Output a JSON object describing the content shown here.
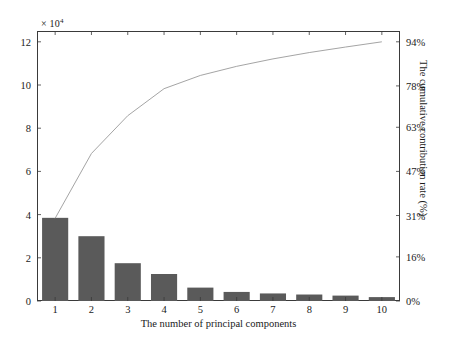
{
  "chart_data": {
    "type": "bar",
    "title": "",
    "xlabel": "The number of principal components",
    "ylabel_left": "",
    "ylabel_right": "The cumulative contribution rate (%)",
    "exponent_label": "× 10",
    "exponent_power": "4",
    "categories": [
      "1",
      "2",
      "3",
      "4",
      "5",
      "6",
      "7",
      "8",
      "9",
      "10"
    ],
    "values": [
      38500,
      30000,
      17500,
      12500,
      6200,
      4200,
      3500,
      3000,
      2500,
      1800
    ],
    "ylim": [
      0,
      125000
    ],
    "yticks_left": [
      0,
      2,
      4,
      6,
      8,
      10,
      12
    ],
    "ytick_labels_left": [
      "0",
      "2",
      "4",
      "6",
      "8",
      "10",
      "12"
    ],
    "yticks_right_pct": [
      0,
      16,
      31,
      47,
      63,
      78,
      94
    ],
    "ytick_labels_right": [
      "0%",
      "16%",
      "31%",
      "47%",
      "63%",
      "78%",
      "94%"
    ],
    "right_axis_max_pct": 94,
    "series": [
      {
        "name": "Eigenvalue",
        "type": "bar",
        "values": [
          38500,
          30000,
          17500,
          12500,
          6200,
          4200,
          3500,
          3000,
          2500,
          1800
        ],
        "color": "#5a5a5a"
      },
      {
        "name": "Cumulative contribution rate",
        "type": "line",
        "axis": "right",
        "values": [
          30.0,
          53.5,
          67.2,
          77.0,
          81.8,
          85.1,
          87.8,
          90.1,
          92.1,
          94.0
        ],
        "color": "#9a9a9a"
      }
    ],
    "grid": false,
    "legend": "none"
  },
  "figure": {
    "caption": ""
  }
}
